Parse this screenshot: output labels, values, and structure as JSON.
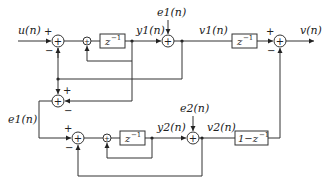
{
  "diagram": {
    "type": "block-diagram",
    "signals": {
      "input": "u(n)",
      "output": "v(n)",
      "y1": "y1(n)",
      "v1": "v1(n)",
      "e1_top": "e1(n)",
      "e1_left": "e1(n)",
      "y2": "y2(n)",
      "v2": "v2(n)",
      "e2": "e2(n)"
    },
    "blocks": {
      "delay1": "z",
      "delay1_exp": "−1",
      "delay2": "z",
      "delay2_exp": "−1",
      "delay3": "z",
      "delay3_exp": "−1",
      "diff": "1−z",
      "diff_exp": "−1"
    },
    "signs": {
      "plus": "+",
      "minus": "−",
      "plus_small": "+"
    },
    "summers": {
      "sum_symbol": "+"
    }
  }
}
